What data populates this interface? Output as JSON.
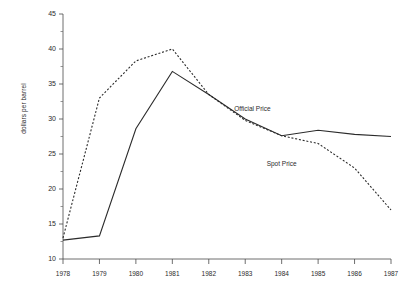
{
  "chart_data": {
    "type": "line",
    "title": "",
    "xlabel": "",
    "ylabel": "dollars per barrel",
    "x": [
      1978,
      1979,
      1980,
      1981,
      1982,
      1983,
      1984,
      1985,
      1986,
      1987
    ],
    "xtick_labels": [
      "1978",
      "1979",
      "1980",
      "1981",
      "1982",
      "1983",
      "1984",
      "1985",
      "1986",
      "1987"
    ],
    "ytick_labels": [
      "10",
      "15",
      "20",
      "25",
      "30",
      "35",
      "40",
      "45"
    ],
    "yticks": [
      10,
      15,
      20,
      25,
      30,
      35,
      40,
      45
    ],
    "yminor_step": 2.5,
    "xlim": [
      1978,
      1987
    ],
    "ylim": [
      10,
      45
    ],
    "grid": false,
    "legend_position": "inline-annotations",
    "series": [
      {
        "name": "Official Price",
        "style": "solid",
        "color": "#2b2b2b",
        "values": [
          12.7,
          13.3,
          28.6,
          36.8,
          33.5,
          30.0,
          27.6,
          28.4,
          27.8,
          27.5
        ]
      },
      {
        "name": "Spot Price",
        "style": "dashed",
        "color": "#2b2b2b",
        "values": [
          13.0,
          33.0,
          38.3,
          40.0,
          33.5,
          29.8,
          27.6,
          26.5,
          23.0,
          17.0
        ]
      }
    ],
    "annotations": [
      {
        "text": "Official Price",
        "x": 1983.2,
        "y": 31.2
      },
      {
        "text": "Spot Price",
        "x": 1984.0,
        "y": 23.3
      }
    ]
  }
}
